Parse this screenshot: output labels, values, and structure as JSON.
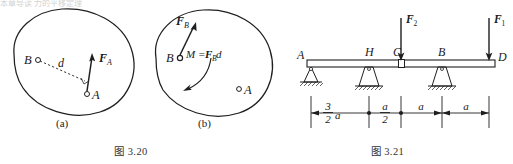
{
  "page": {
    "top_cut_text": "本章导读 力的平移定理"
  },
  "figure_320": {
    "caption": "图 3.20",
    "subcaption_a": "(a)",
    "subcaption_b": "(b)",
    "panel_a": {
      "point_b_label": "B",
      "point_a_label": "A",
      "distance_label": "d",
      "force_label": "F",
      "force_sub": "A"
    },
    "panel_b": {
      "point_b_label": "B",
      "point_a_label": "A",
      "force_label": "F",
      "force_sub": "B",
      "moment_label": "M =",
      "moment_force": "F",
      "moment_sub": "B",
      "moment_dist": "d"
    }
  },
  "figure_321": {
    "caption": "图 3.21",
    "node_labels": [
      "A",
      "H",
      "C",
      "B",
      "D"
    ],
    "loads": [
      {
        "label": "F",
        "sub": "2",
        "at": "C"
      },
      {
        "label": "F",
        "sub": "1",
        "at": "D"
      }
    ],
    "dimensions": [
      {
        "num": "3",
        "den": "2",
        "unit": "a"
      },
      {
        "num": "a",
        "den": "2",
        "unit": ""
      },
      {
        "plain": "a"
      },
      {
        "plain": "a"
      }
    ],
    "supports": [
      "pin",
      "pedestal",
      "pedestal"
    ],
    "hinge_at": "C"
  },
  "colors": {
    "ink": "#1a1a1a",
    "line": "#222222",
    "paper": "#ffffff",
    "faint": "#777777"
  }
}
